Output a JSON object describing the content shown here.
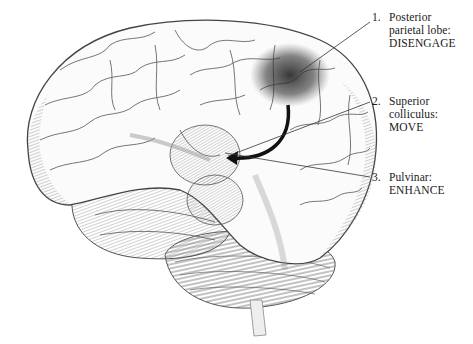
{
  "figure": {
    "arrow_color": "#111111",
    "shading_color": "#2a2a2a"
  },
  "labels": [
    {
      "number": "1.",
      "lines": [
        "Posterior",
        "parietal lobe:",
        "DISENGAGE"
      ]
    },
    {
      "number": "2.",
      "lines": [
        "Superior",
        "colliculus:",
        "MOVE"
      ]
    },
    {
      "number": "3.",
      "lines": [
        "Pulvinar:",
        "ENHANCE"
      ]
    }
  ]
}
